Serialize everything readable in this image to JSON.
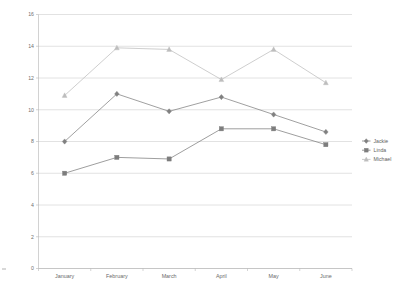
{
  "chart_data": {
    "type": "line",
    "title": "",
    "xlabel": "",
    "ylabel": "",
    "categories": [
      "January",
      "February",
      "March",
      "April",
      "May",
      "June"
    ],
    "yticks": [
      0,
      2,
      4,
      6,
      8,
      10,
      12,
      14,
      16
    ],
    "ylim": [
      0,
      16
    ],
    "grid": "horizontal",
    "legend_position": "right",
    "series": [
      {
        "name": "Jackie",
        "marker": "diamond",
        "color": "#808080",
        "values": [
          8.0,
          11.0,
          9.9,
          10.8,
          9.7,
          8.6
        ]
      },
      {
        "name": "Linda",
        "marker": "square",
        "color": "#7d7d7d",
        "values": [
          6.0,
          7.0,
          6.9,
          8.8,
          8.8,
          7.8
        ]
      },
      {
        "name": "Michael",
        "marker": "triangle",
        "color": "#bdbdbd",
        "values": [
          10.9,
          13.9,
          13.8,
          11.9,
          13.8,
          11.7
        ]
      }
    ]
  },
  "legend": {
    "entries": [
      {
        "label": "Jackie"
      },
      {
        "label": "Linda"
      },
      {
        "label": "Michael"
      }
    ]
  },
  "colors": {
    "gridline": "#c9c9c9",
    "axis": "#b3b3b3",
    "tick_text": "#6f6f6f",
    "category_text": "#6a6a6a",
    "legend_text": "#5f5f5f",
    "background": "#ffffff"
  }
}
